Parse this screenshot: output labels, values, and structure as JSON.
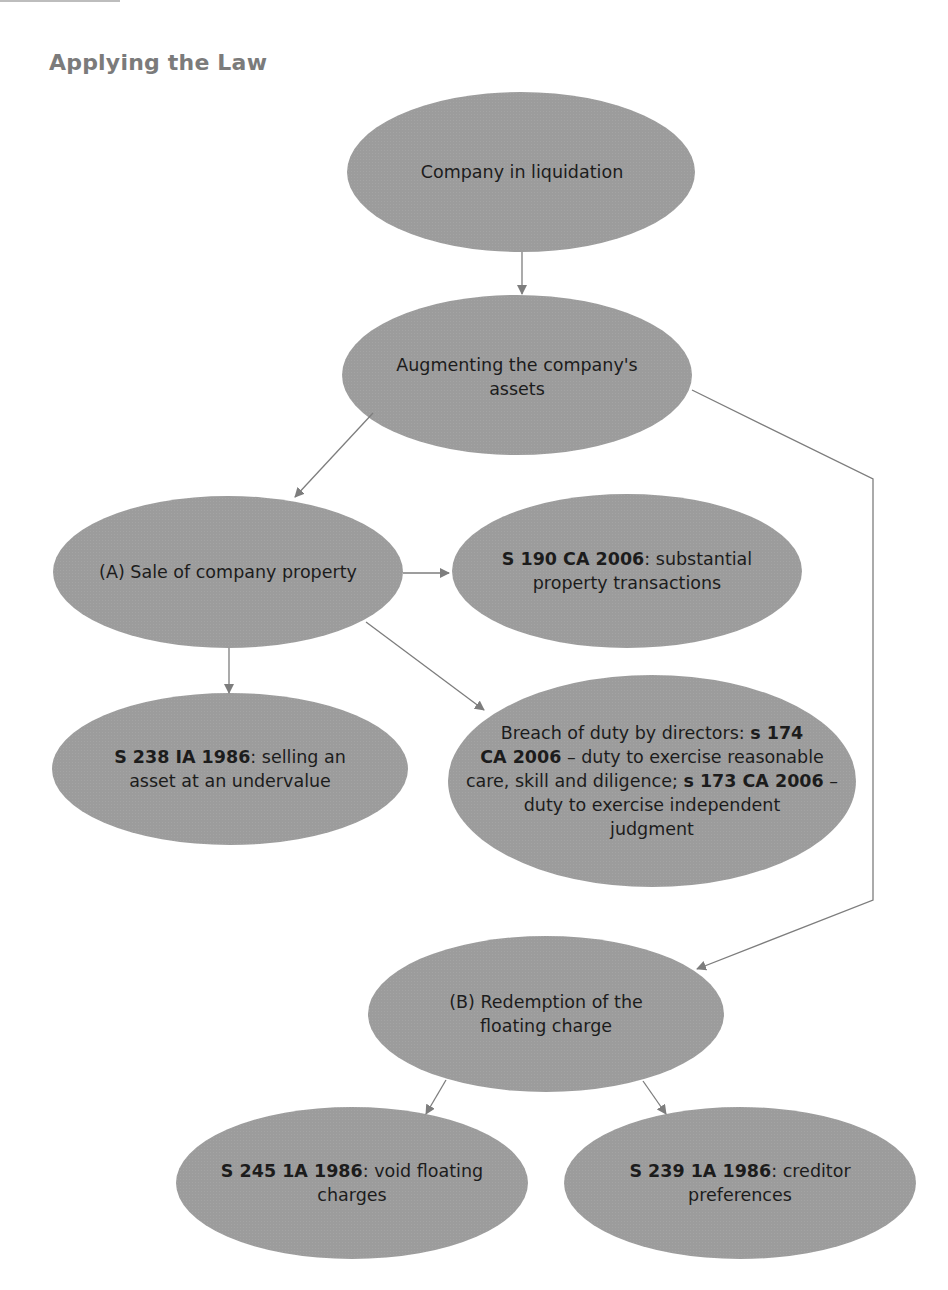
{
  "heading": "Applying the Law",
  "colors": {
    "node_fill": "#9c9c9c",
    "arrow": "#7d7d7d",
    "heading": "#7b7b7b",
    "text": "#1c1c1c"
  },
  "nodes": [
    {
      "id": "company-in-liquidation",
      "lines": [
        {
          "bold": "",
          "rest": "Company in liquidation"
        }
      ]
    },
    {
      "id": "augmenting-assets",
      "lines": [
        {
          "bold": "",
          "rest": "Augmenting the company's"
        },
        {
          "bold": "",
          "rest": "assets"
        }
      ]
    },
    {
      "id": "sale-of-property",
      "lines": [
        {
          "bold": "",
          "rest": "(A) Sale of company property"
        }
      ]
    },
    {
      "id": "s190-ca-2006",
      "lines": [
        {
          "bold": "S 190 CA 2006",
          "rest": ": substantial"
        },
        {
          "bold": "",
          "rest": "property transactions"
        }
      ]
    },
    {
      "id": "s238-ia-1986",
      "lines": [
        {
          "bold": "S 238 IA 1986",
          "rest": ": selling an"
        },
        {
          "bold": "",
          "rest": "asset at an undervalue"
        }
      ]
    },
    {
      "id": "breach-of-duty",
      "lines": [
        {
          "pre": "Breach of duty by directors: ",
          "bold": "s 174",
          "rest": ""
        },
        {
          "pre": "",
          "bold": "CA 2006",
          "rest": " – duty to exercise reasonable"
        },
        {
          "pre": "care, skill and diligence; ",
          "bold": "s 173 CA 2006",
          "rest": " –"
        },
        {
          "pre": "",
          "bold": "",
          "rest": "duty to exercise independent"
        },
        {
          "pre": "",
          "bold": "",
          "rest": "judgment"
        }
      ]
    },
    {
      "id": "redemption-floating-charge",
      "lines": [
        {
          "bold": "",
          "rest": "(B) Redemption of the"
        },
        {
          "bold": "",
          "rest": "floating charge"
        }
      ]
    },
    {
      "id": "s245-ia-1986",
      "lines": [
        {
          "bold": "S 245 1A 1986",
          "rest": ": void floating"
        },
        {
          "bold": "",
          "rest": "charges"
        }
      ]
    },
    {
      "id": "s239-ia-1986",
      "lines": [
        {
          "bold": "S 239 1A 1986",
          "rest": ": creditor"
        },
        {
          "bold": "",
          "rest": "preferences"
        }
      ]
    }
  ],
  "edges": [
    {
      "from": "company-in-liquidation",
      "to": "augmenting-assets"
    },
    {
      "from": "augmenting-assets",
      "to": "sale-of-property"
    },
    {
      "from": "augmenting-assets",
      "to": "redemption-floating-charge"
    },
    {
      "from": "sale-of-property",
      "to": "s190-ca-2006"
    },
    {
      "from": "sale-of-property",
      "to": "s238-ia-1986"
    },
    {
      "from": "sale-of-property",
      "to": "breach-of-duty"
    },
    {
      "from": "redemption-floating-charge",
      "to": "s245-ia-1986"
    },
    {
      "from": "redemption-floating-charge",
      "to": "s239-ia-1986"
    }
  ]
}
